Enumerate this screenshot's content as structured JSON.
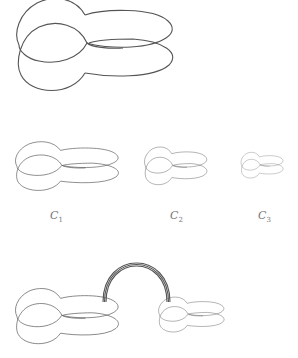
{
  "figure": {
    "labels": [
      {
        "id": "c1",
        "base": "C",
        "sub": "1"
      },
      {
        "id": "c2",
        "base": "C",
        "sub": "2"
      },
      {
        "id": "c3",
        "base": "C",
        "sub": "3"
      }
    ],
    "stroke_color": "#555555",
    "background": "#ffffff"
  }
}
